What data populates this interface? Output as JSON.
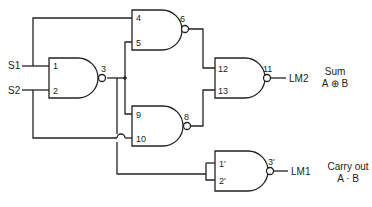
{
  "diagram": {
    "type": "logic-circuit",
    "inputs": [
      {
        "label": "S1"
      },
      {
        "label": "S2"
      }
    ],
    "gates": [
      {
        "id": "g1",
        "type": "NAND",
        "in_pins": [
          "1",
          "2"
        ],
        "out_pin": "3"
      },
      {
        "id": "g2",
        "type": "NAND",
        "in_pins": [
          "4",
          "5"
        ],
        "out_pin": "6"
      },
      {
        "id": "g3",
        "type": "NAND",
        "in_pins": [
          "9",
          "10"
        ],
        "out_pin": "8"
      },
      {
        "id": "g4",
        "type": "NAND",
        "in_pins": [
          "12",
          "13"
        ],
        "out_pin": "11"
      },
      {
        "id": "g5",
        "type": "NAND",
        "in_pins": [
          "1'",
          "2'"
        ],
        "out_pin": "3'"
      }
    ],
    "outputs": [
      {
        "label": "LM2",
        "note_line1": "Sum",
        "note_line2": "A ⊕ B"
      },
      {
        "label": "LM1",
        "note_line1": "Carry out",
        "note_line2": "A · B"
      }
    ]
  }
}
